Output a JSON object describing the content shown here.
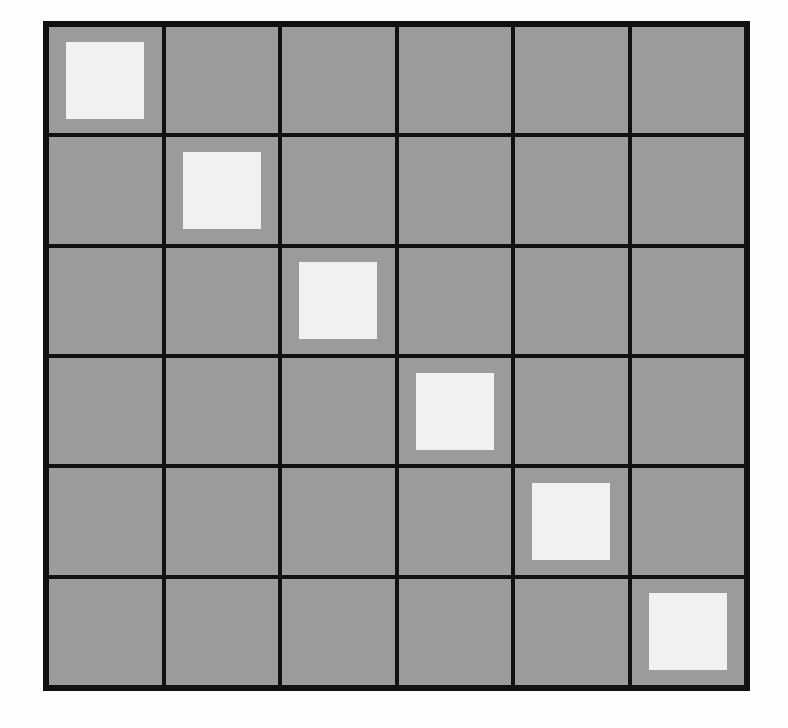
{
  "grid": {
    "rows": 6,
    "cols": 6,
    "cell_color": "#9b9b9b",
    "line_color": "#111111",
    "marker_color": "#f1f1f1",
    "markers": [
      {
        "row": 0,
        "col": 0
      },
      {
        "row": 1,
        "col": 1
      },
      {
        "row": 2,
        "col": 2
      },
      {
        "row": 3,
        "col": 3
      },
      {
        "row": 4,
        "col": 4
      },
      {
        "row": 5,
        "col": 5
      }
    ]
  }
}
